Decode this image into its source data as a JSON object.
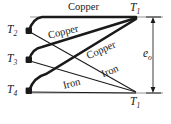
{
  "figure": {
    "type": "thermocouple-circuit-diagram",
    "background_color": "#ffffff",
    "line_color": "#1a1a1a",
    "baseline_color": "#b0b0b0",
    "nodes": [
      {
        "id": "T2",
        "label": "T",
        "subscript": "2",
        "x": 29,
        "y": 31,
        "label_x": 7,
        "label_y": 25
      },
      {
        "id": "T3",
        "label": "T",
        "subscript": "3",
        "x": 29,
        "y": 60,
        "label_x": 7,
        "label_y": 54
      },
      {
        "id": "T4",
        "label": "T",
        "subscript": "4",
        "x": 29,
        "y": 91,
        "label_x": 7,
        "label_y": 85
      },
      {
        "id": "T1top",
        "label": "T",
        "subscript": "1",
        "x": 137,
        "y": 17,
        "label_x": 130,
        "label_y": 2
      },
      {
        "id": "T1bot",
        "label": "T",
        "subscript": "1",
        "x": 137,
        "y": 93,
        "label_x": 130,
        "label_y": 96
      }
    ],
    "conductor_labels": [
      {
        "text": "Copper",
        "x": 68,
        "y": 2,
        "rotation": 0,
        "name": "copper-label-top"
      },
      {
        "text": "Copper",
        "x": 47,
        "y": 28,
        "rotation": -14,
        "name": "copper-label-upper-mid"
      },
      {
        "text": "Copper",
        "x": 85,
        "y": 46,
        "rotation": -24,
        "name": "copper-label-lower-mid"
      },
      {
        "text": "Iron",
        "x": 100,
        "y": 64,
        "rotation": -22,
        "name": "iron-label-upper"
      },
      {
        "text": "Iron",
        "x": 62,
        "y": 76,
        "rotation": -14,
        "name": "iron-label-lower"
      }
    ],
    "emf": {
      "symbol": "e",
      "subscript": "o",
      "label_x": 146,
      "label_y": 49,
      "arrow_x": 153,
      "arrow_top_y": 17,
      "arrow_bottom_y": 93
    }
  }
}
